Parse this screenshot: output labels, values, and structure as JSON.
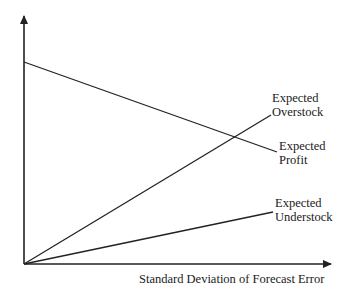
{
  "diagram": {
    "x_axis_label": "Standard Deviation of Forecast Error",
    "y_axis_label": "",
    "curves": [
      {
        "name": "expected-profit",
        "label_line1": "Expected",
        "label_line2": "Profit",
        "trend": "decreasing"
      },
      {
        "name": "expected-overstock",
        "label_line1": "Expected",
        "label_line2": "Overstock",
        "trend": "increasing-steep"
      },
      {
        "name": "expected-understock",
        "label_line1": "Expected",
        "label_line2": "Understock",
        "trend": "increasing-shallow"
      }
    ],
    "line_color": "#222222"
  }
}
